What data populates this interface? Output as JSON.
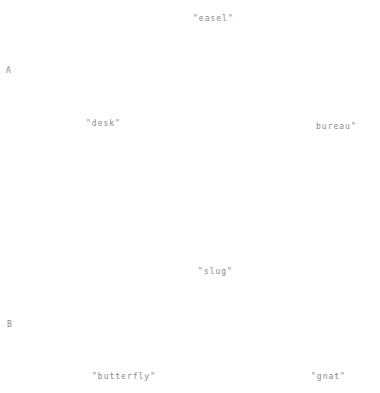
{
  "groups": [
    {
      "label": "A",
      "prompt": "\"easel\"",
      "options": [
        "\"desk\"",
        "bureau\""
      ]
    },
    {
      "label": "B",
      "prompt": "\"slug\"",
      "options": [
        "\"butterfly\"",
        "\"gnat\""
      ]
    }
  ]
}
